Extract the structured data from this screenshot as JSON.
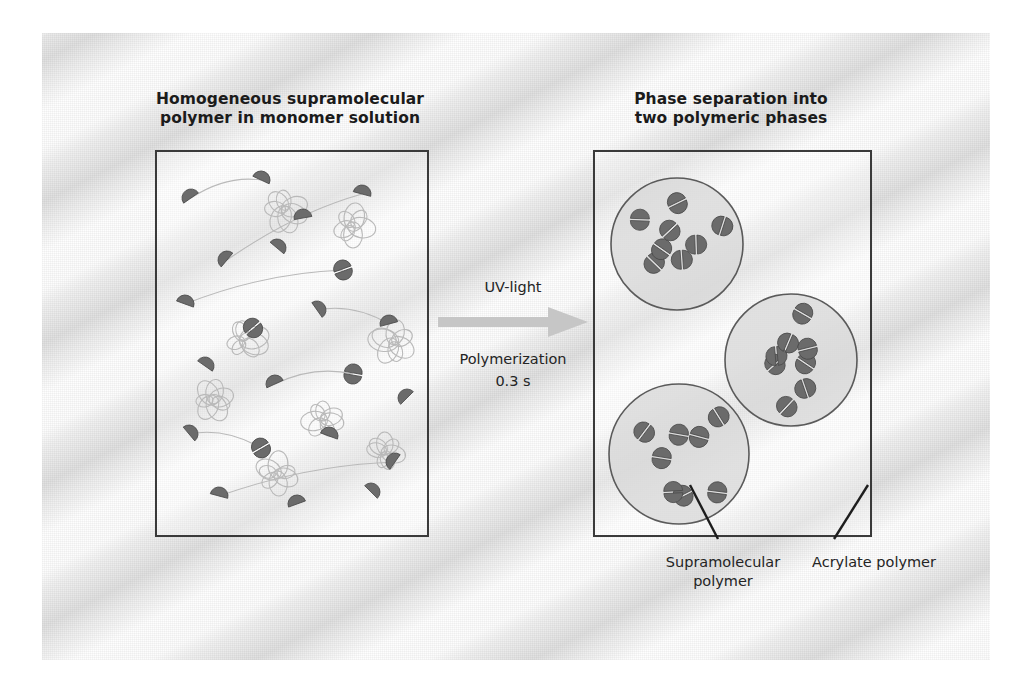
{
  "figure": {
    "left_panel": {
      "title_line1": "Homogeneous supramolecular",
      "title_line2": "polymer in monomer solution"
    },
    "right_panel": {
      "title_line1": "Phase separation into",
      "title_line2": "two polymeric phases"
    },
    "arrow": {
      "label_above": "UV-light",
      "label_below_line1": "Polymerization",
      "label_below_line2": "0.3 s"
    },
    "callouts": {
      "supramolecular_line1": "Supramolecular",
      "supramolecular_line2": "polymer",
      "acrylate": "Acrylate polymer"
    },
    "colors": {
      "panel_border": "#3a3a3a",
      "particle_dark": "#6b6b6b",
      "particle_edge": "#4a4a4a",
      "droplet_fill": "#d7d7d7",
      "droplet_stroke": "#5a5a5a",
      "coil_stroke": "#b9b9b9",
      "arrow_fill": "#c6c6c6",
      "background": "#eeeeee",
      "text": "#1b1b1b"
    }
  },
  "chart_data": {
    "type": "diagram",
    "left_panel_particles": {
      "description": "dark half-disc monomer units, some paired into dimers, dispersed with light coil clusters",
      "units": [
        {
          "x": 34,
          "y": 46,
          "rot": -35,
          "paired": false
        },
        {
          "x": 104,
          "y": 28,
          "rot": 25,
          "paired": false
        },
        {
          "x": 146,
          "y": 66,
          "rot": -10,
          "paired": false
        },
        {
          "x": 205,
          "y": 42,
          "rot": 15,
          "paired": false
        },
        {
          "x": 70,
          "y": 108,
          "rot": -50,
          "paired": false
        },
        {
          "x": 120,
          "y": 96,
          "rot": 40,
          "paired": false
        },
        {
          "x": 186,
          "y": 118,
          "rot": -20,
          "paired": true
        },
        {
          "x": 28,
          "y": 152,
          "rot": 20,
          "paired": false
        },
        {
          "x": 96,
          "y": 176,
          "rot": -40,
          "paired": true
        },
        {
          "x": 160,
          "y": 158,
          "rot": 55,
          "paired": false
        },
        {
          "x": 232,
          "y": 172,
          "rot": -15,
          "paired": false
        },
        {
          "x": 48,
          "y": 214,
          "rot": 35,
          "paired": false
        },
        {
          "x": 118,
          "y": 232,
          "rot": -25,
          "paired": false
        },
        {
          "x": 196,
          "y": 222,
          "rot": 10,
          "paired": true
        },
        {
          "x": 250,
          "y": 246,
          "rot": -45,
          "paired": false
        },
        {
          "x": 32,
          "y": 282,
          "rot": 50,
          "paired": false
        },
        {
          "x": 104,
          "y": 296,
          "rot": -30,
          "paired": true
        },
        {
          "x": 172,
          "y": 284,
          "rot": 20,
          "paired": false
        },
        {
          "x": 238,
          "y": 310,
          "rot": -55,
          "paired": false
        },
        {
          "x": 62,
          "y": 344,
          "rot": 15,
          "paired": false
        },
        {
          "x": 140,
          "y": 352,
          "rot": -20,
          "paired": false
        },
        {
          "x": 214,
          "y": 340,
          "rot": 45,
          "paired": false
        }
      ],
      "coils": [
        {
          "x": 128,
          "y": 58,
          "r": 22
        },
        {
          "x": 196,
          "y": 74,
          "r": 20
        },
        {
          "x": 88,
          "y": 188,
          "r": 21
        },
        {
          "x": 236,
          "y": 190,
          "r": 22
        },
        {
          "x": 56,
          "y": 248,
          "r": 19
        },
        {
          "x": 166,
          "y": 268,
          "r": 20
        },
        {
          "x": 120,
          "y": 322,
          "r": 21
        },
        {
          "x": 228,
          "y": 300,
          "r": 19
        }
      ]
    },
    "right_panel_droplets": [
      {
        "cx": 82,
        "cy": 92,
        "r": 66,
        "particles": 8
      },
      {
        "cx": 196,
        "cy": 208,
        "r": 66,
        "particles": 8
      },
      {
        "cx": 84,
        "cy": 302,
        "r": 70,
        "particles": 8
      }
    ],
    "leader_lines": [
      {
        "from": "droplet-bottom-left",
        "to": "Supramolecular polymer"
      },
      {
        "from": "panel-matrix",
        "to": "Acrylate polymer"
      }
    ]
  }
}
